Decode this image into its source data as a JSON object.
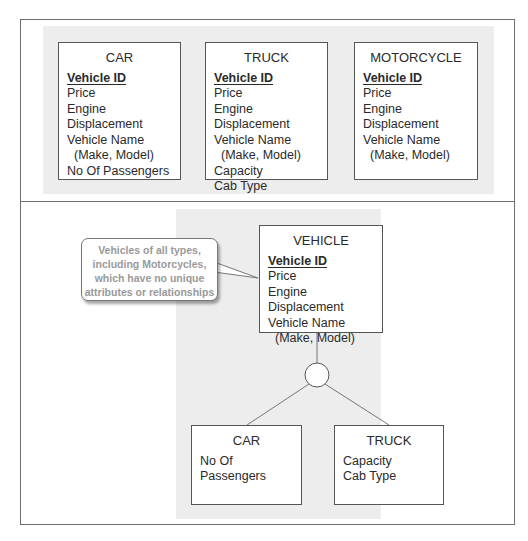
{
  "top_panel": {
    "entities": [
      {
        "name": "CAR",
        "primary_key": "Vehicle ID",
        "attributes": [
          "Price",
          "Engine Displacement",
          "Vehicle Name",
          "(Make, Model)",
          "No Of Passengers"
        ]
      },
      {
        "name": "TRUCK",
        "primary_key": "Vehicle ID",
        "attributes": [
          "Price",
          "Engine Displacement",
          "Vehicle Name",
          "(Make, Model)",
          "Capacity",
          "Cab Type"
        ]
      },
      {
        "name": "MOTORCYCLE",
        "primary_key": "Vehicle ID",
        "attributes": [
          "Price",
          "Engine Displacement",
          "Vehicle Name",
          "(Make, Model)"
        ]
      }
    ]
  },
  "bottom_panel": {
    "supertype": {
      "name": "VEHICLE",
      "primary_key": "Vehicle ID",
      "attributes": [
        "Price",
        "Engine Displacement",
        "Vehicle Name",
        "(Make, Model)"
      ]
    },
    "subtypes": [
      {
        "name": "CAR",
        "attributes": [
          "No Of Passengers"
        ]
      },
      {
        "name": "TRUCK",
        "attributes": [
          "Capacity",
          "Cab Type"
        ]
      }
    ],
    "callout": {
      "lines": [
        "Vehicles of all types,",
        "including Motorcycles,",
        "which have no unique",
        "attributes or relationships"
      ]
    }
  },
  "colors": {
    "frame": "#6e6e6e",
    "panel_bg": "#ededed",
    "box_border": "#555555",
    "callout_text": "#9a9a9a"
  }
}
